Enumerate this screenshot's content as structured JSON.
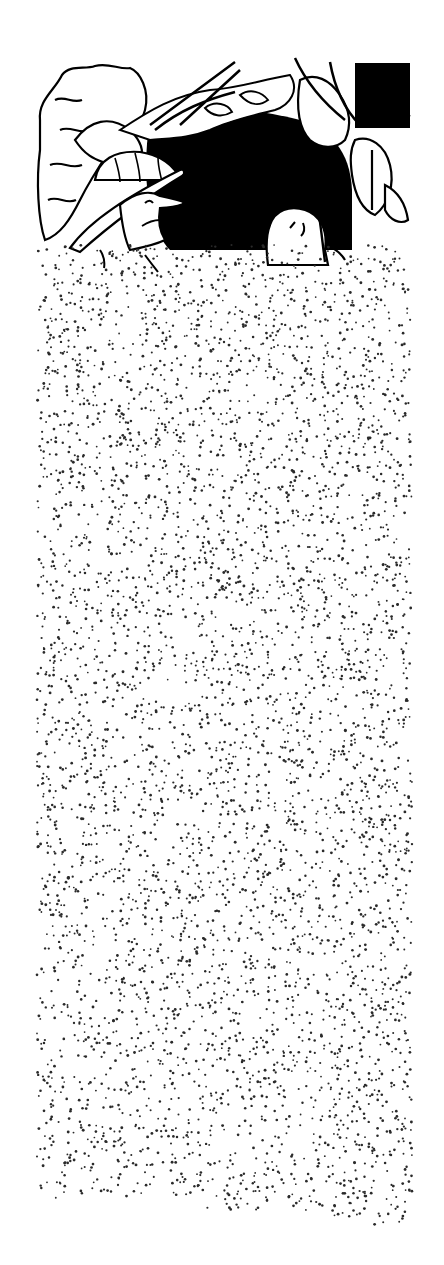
{
  "illustration": {
    "title": "Explorer in pith helmet peering through jungle foliage beside a hidden creature",
    "style": "black-and-white pen and ink cartoon with stippled ground",
    "colors": {
      "ink": "#000000",
      "paper": "#ffffff",
      "stipple": "#2a2a2a"
    },
    "scene": {
      "frame": {
        "x": 37,
        "y": 60,
        "width": 375,
        "height": 205
      },
      "characters": [
        {
          "name": "explorer",
          "position": "left",
          "attire": "pith helmet"
        },
        {
          "name": "creature",
          "position": "center-right",
          "feature": "rounded head with small eyes"
        }
      ],
      "background": "dense jungle leaves and vines with dark shadow"
    },
    "stipple_field": {
      "x": 37,
      "y": 245,
      "width": 375,
      "bottom": 1200,
      "ragged_bottom_right": 1235,
      "dot_count": 5200,
      "seed": 7
    }
  }
}
